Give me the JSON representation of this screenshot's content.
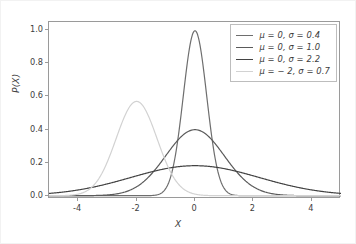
{
  "chart_data": {
    "type": "line",
    "title": "",
    "xlabel": "X",
    "ylabel": "P(X)",
    "xlim": [
      -5,
      5
    ],
    "ylim": [
      -0.02,
      1.05
    ],
    "grid": false,
    "legend_position": "upper right",
    "xticks": [
      "-4",
      "-2",
      "0",
      "2",
      "4"
    ],
    "xtick_values": [
      -4,
      -2,
      0,
      2,
      4
    ],
    "yticks": [
      "0.0",
      "0.2",
      "0.4",
      "0.6",
      "0.8",
      "1.0"
    ],
    "ytick_values": [
      0.0,
      0.2,
      0.4,
      0.6,
      0.8,
      1.0
    ],
    "series": [
      {
        "name": "μ = 0, σ = 0.4",
        "mu": 0,
        "sigma": 0.4,
        "peak": 0.997,
        "color": "#6e6e6e"
      },
      {
        "name": "μ = 0, σ = 1.0",
        "mu": 0,
        "sigma": 1.0,
        "peak": 0.399,
        "color": "#5a5a5a"
      },
      {
        "name": "μ = 0, σ = 2.2",
        "mu": 0,
        "sigma": 2.2,
        "peak": 0.181,
        "color": "#434343"
      },
      {
        "name": "μ = − 2, σ = 0.7",
        "mu": -2,
        "sigma": 0.7,
        "peak": 0.57,
        "color": "#d2d2d2"
      }
    ]
  }
}
